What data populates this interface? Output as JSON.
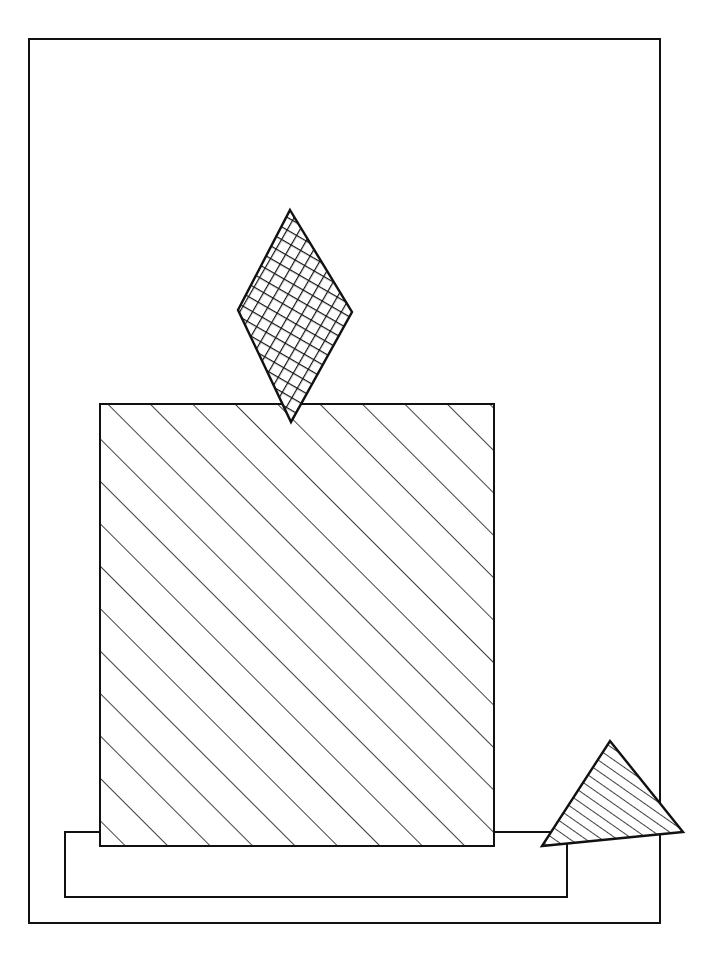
{
  "figure": {
    "stroke_color": "#111111",
    "background_color": "#ffffff",
    "frame": {
      "x": 29,
      "y": 39,
      "w": 631,
      "h": 884
    },
    "shapes": [
      {
        "id": "diamond",
        "kind": "rhombus",
        "fill": "cross-hatch",
        "points": [
          [
            290,
            210
          ],
          [
            352,
            312
          ],
          [
            291,
            422
          ],
          [
            238,
            310
          ]
        ]
      },
      {
        "id": "square",
        "kind": "square",
        "fill": "diagonal-hatch",
        "x": 100,
        "y": 404,
        "w": 394,
        "h": 442
      },
      {
        "id": "base",
        "kind": "rectangle",
        "fill": "none",
        "x": 65,
        "y": 832,
        "w": 502,
        "h": 65
      },
      {
        "id": "triangle",
        "kind": "triangle",
        "fill": "parallel-hatch",
        "points": [
          [
            610,
            741
          ],
          [
            683,
            832
          ],
          [
            542,
            846
          ]
        ]
      }
    ]
  }
}
